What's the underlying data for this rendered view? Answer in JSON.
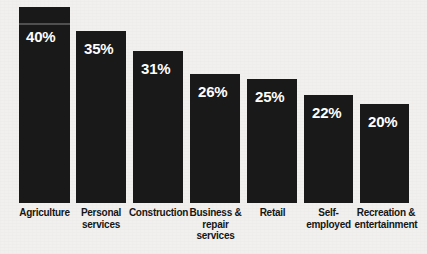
{
  "chart_data": {
    "type": "bar",
    "title": "",
    "subtitle": "",
    "xlabel": "",
    "ylabel": "",
    "ylim": [
      0,
      43
    ],
    "grid": false,
    "legend": false,
    "orientation": "vertical",
    "value_label_suffix": "%",
    "categories": [
      "Agriculture",
      "Personal services",
      "Construction",
      "Business & repair services",
      "Retail",
      "Self-employed",
      "Recreation & entertainment"
    ],
    "values": [
      40,
      35,
      31,
      26,
      25,
      22,
      20
    ],
    "value_labels": [
      "40%",
      "35%",
      "31%",
      "26%",
      "25%",
      "22%",
      "20%"
    ],
    "colors": {
      "bar": "#191919",
      "background": "#f1f0ee",
      "value_text": "#ffffff",
      "label_text": "#161616"
    }
  },
  "bars": [
    {
      "category": "Agriculture",
      "label_lines": [
        "Agriculture"
      ],
      "value": 40,
      "value_label": "40%",
      "left": 19,
      "width": 51,
      "top": 7,
      "height": 196,
      "value_left": 7,
      "value_top": 22,
      "label_top": 207,
      "label_left": 2,
      "label_width": 85,
      "streak": {
        "top": 16,
        "height": 2
      }
    },
    {
      "category": "Personal services",
      "label_lines": [
        "Personal",
        "services"
      ],
      "value": 35,
      "value_label": "35%",
      "left": 76,
      "width": 50,
      "top": 31,
      "height": 172,
      "value_left": 8,
      "value_top": 10,
      "label_top": 207,
      "label_left": 61,
      "label_width": 80,
      "streak": null
    },
    {
      "category": "Construction",
      "label_lines": [
        "Construction"
      ],
      "value": 31,
      "value_label": "31%",
      "left": 133,
      "width": 50,
      "top": 51,
      "height": 152,
      "value_left": 8,
      "value_top": 10,
      "label_top": 207,
      "label_left": 113,
      "label_width": 91,
      "streak": null
    },
    {
      "category": "Business & repair services",
      "label_lines": [
        "Business &",
        "repair",
        "services"
      ],
      "value": 26,
      "value_label": "26%",
      "left": 190,
      "width": 50,
      "top": 74,
      "height": 129,
      "value_left": 8,
      "value_top": 10,
      "label_top": 207,
      "label_left": 180,
      "label_width": 71,
      "streak": null
    },
    {
      "category": "Retail",
      "label_lines": [
        "Retail"
      ],
      "value": 25,
      "value_label": "25%",
      "left": 247,
      "width": 50,
      "top": 79,
      "height": 124,
      "value_left": 8,
      "value_top": 10,
      "label_top": 207,
      "label_left": 237,
      "label_width": 71,
      "streak": null
    },
    {
      "category": "Self-employed",
      "label_lines": [
        "Self-",
        "employed"
      ],
      "value": 22,
      "value_label": "22%",
      "left": 304,
      "width": 49,
      "top": 95,
      "height": 108,
      "value_left": 8,
      "value_top": 10,
      "label_top": 207,
      "label_left": 292,
      "label_width": 73,
      "streak": null
    },
    {
      "category": "Recreation & entertainment",
      "label_lines": [
        "Recreation &",
        "entertainment"
      ],
      "value": 20,
      "value_label": "20%",
      "left": 360,
      "width": 49,
      "top": 104,
      "height": 99,
      "value_left": 8,
      "value_top": 10,
      "label_top": 207,
      "label_left": 348,
      "label_width": 76,
      "streak": null
    }
  ]
}
